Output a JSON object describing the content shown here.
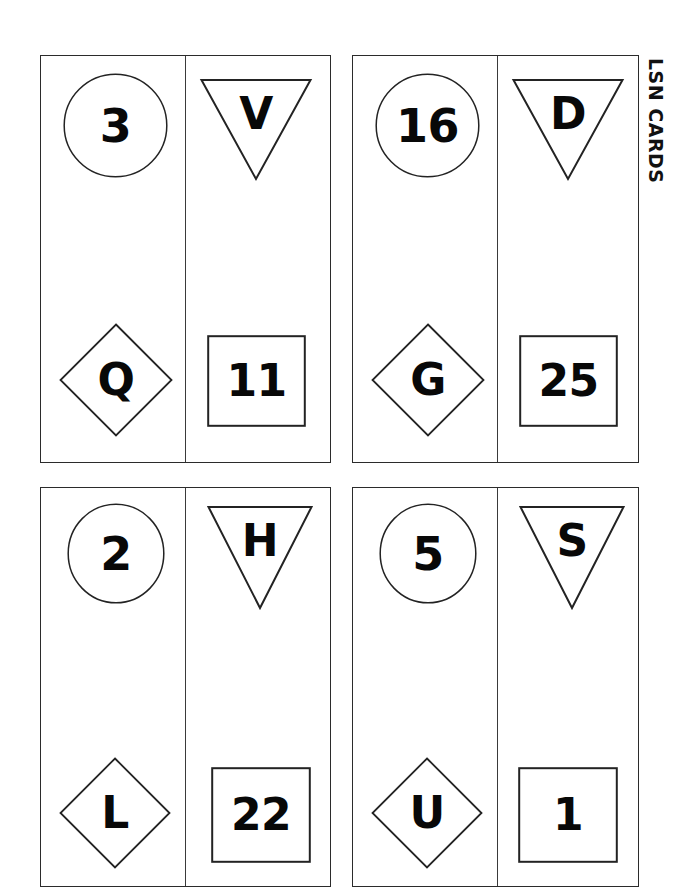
{
  "sheet": {
    "caption": "LSN CARDS",
    "background_color": "#ffffff",
    "ink_color": "#1a1a1a"
  },
  "cards": [
    {
      "id": "card-1",
      "left_column": {
        "top": {
          "shape": "circle",
          "value": "3"
        },
        "bottom": {
          "shape": "diamond",
          "value": "Q"
        }
      },
      "right_column": {
        "top": {
          "shape": "triangle-down",
          "value": "V"
        },
        "bottom": {
          "shape": "square",
          "value": "11"
        }
      }
    },
    {
      "id": "card-2",
      "left_column": {
        "top": {
          "shape": "circle",
          "value": "16"
        },
        "bottom": {
          "shape": "diamond",
          "value": "G"
        }
      },
      "right_column": {
        "top": {
          "shape": "triangle-down",
          "value": "D"
        },
        "bottom": {
          "shape": "square",
          "value": "25"
        }
      }
    },
    {
      "id": "card-3",
      "left_column": {
        "top": {
          "shape": "circle",
          "value": "2"
        },
        "bottom": {
          "shape": "diamond",
          "value": "L"
        }
      },
      "right_column": {
        "top": {
          "shape": "triangle-down",
          "value": "H"
        },
        "bottom": {
          "shape": "square",
          "value": "22"
        }
      }
    },
    {
      "id": "card-4",
      "left_column": {
        "top": {
          "shape": "circle",
          "value": "5"
        },
        "bottom": {
          "shape": "diamond",
          "value": "U"
        }
      },
      "right_column": {
        "top": {
          "shape": "triangle-down",
          "value": "S"
        },
        "bottom": {
          "shape": "square",
          "value": "1"
        }
      }
    }
  ]
}
